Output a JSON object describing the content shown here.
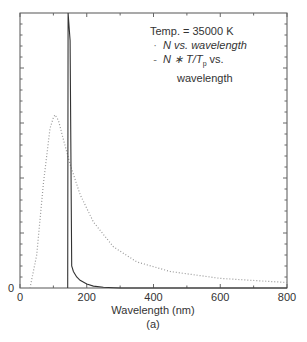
{
  "chart_data": {
    "type": "line",
    "title": "",
    "xlabel": "Wavelength (nm)",
    "ylabel": "",
    "caption": "(a)",
    "xlim": [
      0,
      800
    ],
    "ylim": [
      0,
      1
    ],
    "x_ticks": [
      "0",
      "200",
      "400",
      "600",
      "800"
    ],
    "y_ticks": [
      "0"
    ],
    "grid": false,
    "legend_position": "top-right (inside)",
    "annotation": "Temp. = 35000 K",
    "series": [
      {
        "name": "N vs. wavelength",
        "style": "solid",
        "x": [
          143,
          144,
          146,
          150,
          155,
          160,
          170,
          180,
          200,
          220,
          250,
          280,
          300,
          400,
          800
        ],
        "y": [
          0,
          1.0,
          0.97,
          0.9,
          0.08,
          0.06,
          0.04,
          0.028,
          0.014,
          0.007,
          0.003,
          0.001,
          0.0,
          0.0,
          0.0
        ]
      },
      {
        "name": "N * T/T_p vs. wavelength",
        "style": "dotted",
        "x": [
          30,
          50,
          70,
          90,
          100,
          105,
          115,
          130,
          150,
          180,
          220,
          280,
          350,
          450,
          600,
          800
        ],
        "y": [
          0.0,
          0.12,
          0.38,
          0.58,
          0.62,
          0.63,
          0.61,
          0.54,
          0.45,
          0.34,
          0.24,
          0.15,
          0.095,
          0.06,
          0.035,
          0.02
        ]
      }
    ]
  },
  "legend": {
    "temp": "Temp. = 35000 K",
    "item1_mark": "·",
    "item1": "N vs. wavelength",
    "item2_mark": "-",
    "item2_a": "N ∗ T/T",
    "item2_sub": "p",
    "item2_b": " vs.",
    "item2_c": "wavelength"
  },
  "axis": {
    "xlabel": "Wavelength (nm)",
    "caption": "(a)",
    "y_zero": "0",
    "x_ticks": [
      "0",
      "200",
      "400",
      "600",
      "800"
    ]
  }
}
